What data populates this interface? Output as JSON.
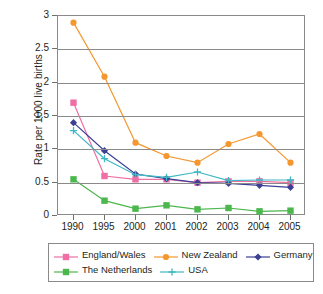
{
  "chart_data": {
    "type": "line",
    "title": "",
    "xlabel": "",
    "ylabel": "Rate per 1000 live births",
    "categories": [
      "1990",
      "1995",
      "2000",
      "2001",
      "2002",
      "2003",
      "2004",
      "2005"
    ],
    "ylim": [
      0,
      3
    ],
    "yticks": [
      "0",
      "0.5",
      "1",
      "1.5",
      "2",
      "2.5",
      "3"
    ],
    "ytick_values": [
      0,
      0.5,
      1,
      1.5,
      2,
      2.5,
      3
    ],
    "grid": true,
    "legend_position": "bottom",
    "series": [
      {
        "name": "England/Wales",
        "color": "#ef6fa4",
        "marker": "square",
        "values": [
          1.7,
          0.6,
          0.55,
          0.55,
          0.5,
          0.52,
          0.52,
          0.5
        ]
      },
      {
        "name": "New Zealand",
        "color": "#f5972f",
        "marker": "circle",
        "values": [
          2.9,
          2.09,
          1.1,
          0.9,
          0.8,
          1.08,
          1.23,
          0.8
        ]
      },
      {
        "name": "Germany",
        "color": "#3b3f96",
        "marker": "diamond",
        "values": [
          1.4,
          0.98,
          0.63,
          0.56,
          0.5,
          0.49,
          0.46,
          0.43
        ]
      },
      {
        "name": "The Netherlands",
        "color": "#4cb74c",
        "marker": "square",
        "values": [
          0.55,
          0.23,
          0.11,
          0.16,
          0.1,
          0.12,
          0.07,
          0.08
        ]
      },
      {
        "name": "USA",
        "color": "#3fb8c4",
        "marker": "plus",
        "values": [
          1.28,
          0.86,
          0.62,
          0.58,
          0.66,
          0.53,
          0.54,
          0.54
        ]
      }
    ]
  },
  "axis_color": "#8a8a8a",
  "text_color": "#231f20"
}
